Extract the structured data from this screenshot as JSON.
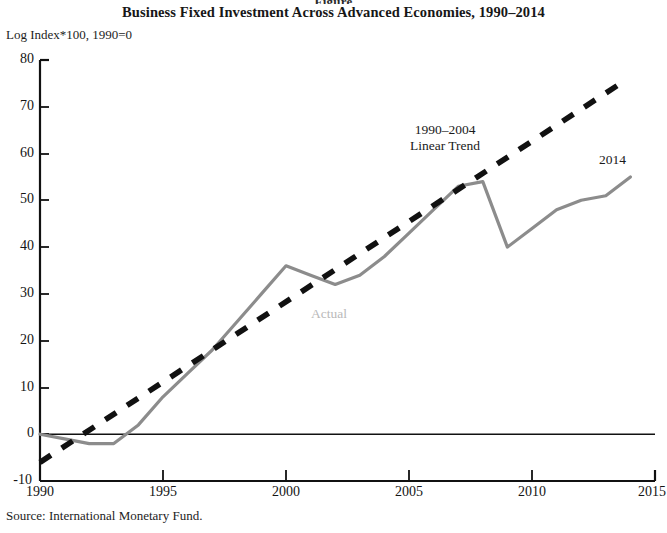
{
  "figure_number": "Figure",
  "header": {
    "title": "Business Fixed Investment Across Advanced Economies, 1990–2014",
    "units_label": "Log Index*100, 1990=0"
  },
  "footer": {
    "source": "Source: International Monetary Fund."
  },
  "annotations": {
    "trend_line1": "1990–2004",
    "trend_line2": "Linear Trend",
    "actual": "Actual",
    "endpoint_year": "2014"
  },
  "colors": {
    "actual_line": "#8c8c8c",
    "trend_line": "#111111",
    "axis": "#111111",
    "actual_label": "#b9b9b9",
    "background": "#ffffff"
  },
  "chart_data": {
    "type": "line",
    "title": "Business Fixed Investment Across Advanced Economies, 1990–2014",
    "xlabel": "",
    "ylabel": "Log Index*100, 1990=0",
    "xlim": [
      1990,
      2015
    ],
    "ylim": [
      -10,
      80
    ],
    "yticks": [
      -10,
      0,
      10,
      20,
      30,
      40,
      50,
      60,
      70,
      80
    ],
    "xticks": [
      1990,
      1995,
      2000,
      2005,
      2010,
      2015
    ],
    "grid": false,
    "legend": "inline-annotations",
    "zero_line": 0,
    "series": [
      {
        "name": "Actual",
        "style": "solid",
        "color": "#8c8c8c",
        "x": [
          1990,
          1991,
          1992,
          1993,
          1994,
          1995,
          1996,
          1997,
          1998,
          1999,
          2000,
          2001,
          2002,
          2003,
          2004,
          2005,
          2006,
          2007,
          2008,
          2009,
          2010,
          2011,
          2012,
          2013,
          2014
        ],
        "values": [
          0,
          -1,
          -2,
          -2,
          2,
          8,
          13,
          18,
          24,
          30,
          36,
          34,
          32,
          34,
          38,
          43,
          48,
          53,
          54,
          40,
          44,
          48,
          50,
          51,
          55
        ]
      },
      {
        "name": "1990–2004 Linear Trend",
        "style": "dashed",
        "color": "#111111",
        "x": [
          1990,
          2013.6
        ],
        "values": [
          -6,
          75
        ]
      }
    ]
  }
}
